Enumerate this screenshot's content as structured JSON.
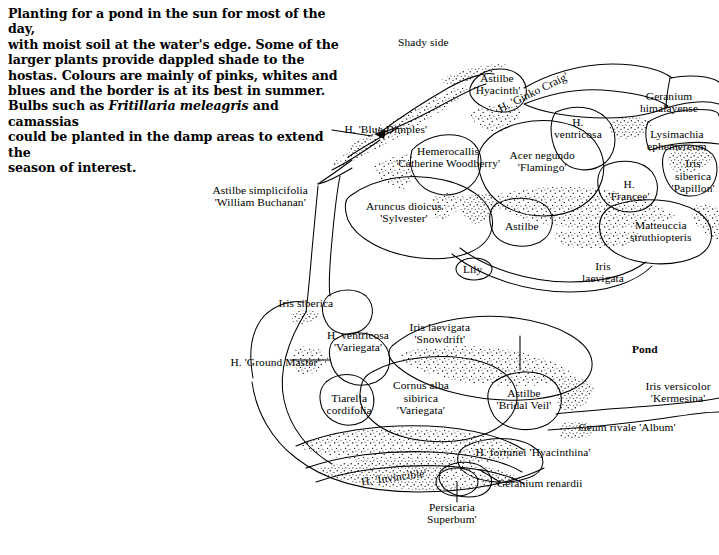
{
  "intro": {
    "lines": [
      "Planting for a pond in the sun for most of the day,",
      "with moist soil at the water's edge. Some of the",
      "larger plants provide dappled shade to the",
      "hostas. Colours are mainly of pinks, whites and",
      "blues and the border is at its best in summer."
    ],
    "bulb_prefix": "Bulbs such as ",
    "bulb_italic": "Fritillaria meleagris",
    "bulb_suffix": " and camassias",
    "tail_lines": [
      "could be planted in the damp areas to extend the",
      "season of interest."
    ]
  },
  "annotations": {
    "shady_side": "Shady side",
    "pond": "Pond",
    "lily": "Lily"
  },
  "colors": {
    "ink": "#000000",
    "background": "#ffffff",
    "stipple": "#111111"
  },
  "plants": [
    {
      "id": "astilbe-hyacinth",
      "text": "Astilbe\n'Hyacinth'",
      "x": 497,
      "y": 84,
      "align": "center"
    },
    {
      "id": "ginko-craig",
      "text": "H. 'Ginko Craig'",
      "x": 533,
      "y": 92,
      "align": "left",
      "rotate": -26
    },
    {
      "id": "geranium-himalayense",
      "text": "Geranium\nhimalayense",
      "x": 669,
      "y": 102,
      "align": "center"
    },
    {
      "id": "h-ventricosa",
      "text": "H.\nventricosa",
      "x": 578,
      "y": 128,
      "align": "center"
    },
    {
      "id": "lysimachia-ephemereum",
      "text": "Lysimachia\nephemereum",
      "x": 677,
      "y": 140,
      "align": "center"
    },
    {
      "id": "h-blue-dimples",
      "text": "H. 'Blue Dimples'",
      "x": 386,
      "y": 129,
      "align": "center"
    },
    {
      "id": "hemerocallis-catherine",
      "text": "Hemerocallis\n'Catherine Woodberry'",
      "x": 448,
      "y": 157,
      "align": "center"
    },
    {
      "id": "acer-negundo-flamingo",
      "text": "Acer negundo\n'Flamingo'",
      "x": 542,
      "y": 161,
      "align": "center"
    },
    {
      "id": "iris-sibirica-papillon",
      "text": "Iris\nsiberica\n'Papillon'",
      "x": 693,
      "y": 176,
      "align": "center"
    },
    {
      "id": "astilbe-simplicifolia",
      "text": "Astilbe simplicifolia\n'William Buchanan'",
      "x": 260,
      "y": 196,
      "align": "center"
    },
    {
      "id": "h-francee",
      "text": "H.\n'Francee'",
      "x": 629,
      "y": 190,
      "align": "center"
    },
    {
      "id": "aruncus-dioicus",
      "text": "Aruncus dioicus\n'Sylvester'",
      "x": 404,
      "y": 212,
      "align": "center"
    },
    {
      "id": "matteuccia",
      "text": "Matteuccia\nstruthiopteris",
      "x": 661,
      "y": 231,
      "align": "center"
    },
    {
      "id": "astilbe-plain",
      "text": "Astilbe",
      "x": 522,
      "y": 226,
      "align": "center"
    },
    {
      "id": "iris-laevigata",
      "text": "Iris\nlaevigata",
      "x": 603,
      "y": 272,
      "align": "center"
    },
    {
      "id": "iris-siberica-left",
      "text": "Iris siberica",
      "x": 306,
      "y": 303,
      "align": "center"
    },
    {
      "id": "iris-laevigata-snowdrift",
      "text": "Iris laevigata\n'Snowdrift'",
      "x": 440,
      "y": 333,
      "align": "center"
    },
    {
      "id": "h-ventricosa-variegata",
      "text": "H. ventricosa\n'Variegata'",
      "x": 358,
      "y": 341,
      "align": "center"
    },
    {
      "id": "h-ground-master",
      "text": "H. 'Ground Master'",
      "x": 275,
      "y": 362,
      "align": "center"
    },
    {
      "id": "cornus-alba",
      "text": "Cornus alba\nsibirica\n'Variegata'",
      "x": 421,
      "y": 398,
      "align": "center"
    },
    {
      "id": "tiarella-cordifolia",
      "text": "Tiarella\ncordifolia",
      "x": 349,
      "y": 404,
      "align": "center"
    },
    {
      "id": "astilbe-bridal-veil",
      "text": "Astilbe\n'Bridal Veil'",
      "x": 524,
      "y": 399,
      "align": "center"
    },
    {
      "id": "iris-versicolor",
      "text": "Iris versicolor\n'Kermesina'",
      "x": 678,
      "y": 392,
      "align": "center"
    },
    {
      "id": "geum-rivale-album",
      "text": "Geum rivale 'Album'",
      "x": 627,
      "y": 427,
      "align": "center"
    },
    {
      "id": "h-fortunei",
      "text": "H. fortunei 'Hyacinthina'",
      "x": 533,
      "y": 452,
      "align": "center"
    },
    {
      "id": "h-invincible",
      "text": "H. 'Invincible'",
      "x": 394,
      "y": 477,
      "align": "center",
      "rotate": -8
    },
    {
      "id": "geranium-renardii",
      "text": "Geranium renardii",
      "x": 540,
      "y": 483,
      "align": "center"
    },
    {
      "id": "persicaria-superbum",
      "text": "Persicaria\nSuperbum'",
      "x": 452,
      "y": 513,
      "align": "center"
    }
  ]
}
